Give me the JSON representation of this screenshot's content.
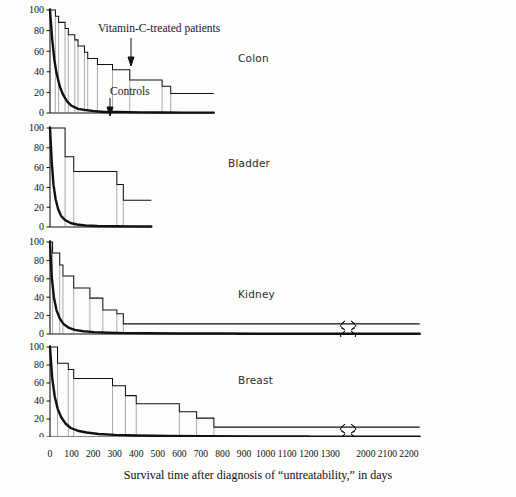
{
  "figure": {
    "xlabel": "Survival time after diagnosis of “untreatability,” in days",
    "annotations": {
      "treated": "Vitamin-C-treated patients",
      "controls": "Controls"
    }
  },
  "chart_data": {
    "type": "line",
    "title": "",
    "xlabel": "Survival time after diagnosis of “untreatability,” in days",
    "ylabel": "",
    "ylim": [
      0,
      100
    ],
    "xlim": [
      0,
      2250
    ],
    "grid": false,
    "legend_position": "inline-annotations",
    "axis_break": {
      "from": 1350,
      "to": 1950
    },
    "yticks": [
      0,
      20,
      40,
      60,
      80,
      100
    ],
    "xticks": [
      0,
      100,
      200,
      300,
      400,
      500,
      600,
      700,
      800,
      900,
      1000,
      1100,
      1200,
      1300,
      2000,
      2100,
      2200
    ],
    "xticklabels": [
      "0",
      "100",
      "200",
      "300",
      "400",
      "500",
      "600",
      "700",
      "800",
      "900",
      "1000",
      "1100",
      "1200",
      "1300",
      "2000",
      "2100",
      "2200"
    ],
    "panels": [
      {
        "name": "Colon",
        "xmax": 760,
        "series": [
          {
            "name": "Vitamin-C-treated patients",
            "style": "step",
            "x": [
              0,
              10,
              25,
              40,
              55,
              70,
              85,
              100,
              115,
              130,
              145,
              160,
              175,
              190,
              205,
              220,
              250,
              290,
              330,
              370,
              420,
              470,
              520,
              560,
              610,
              660,
              760
            ],
            "y": [
              100,
              100,
              94,
              88,
              88,
              82,
              76,
              76,
              71,
              65,
              65,
              59,
              53,
              53,
              53,
              47,
              47,
              42,
              42,
              32,
              32,
              32,
              26,
              19,
              19,
              19,
              19
            ]
          },
          {
            "name": "Controls",
            "style": "smooth",
            "x": [
              0,
              10,
              20,
              30,
              45,
              60,
              80,
              100,
              130,
              160,
              200,
              250,
              320,
              420,
              520,
              620,
              760
            ],
            "y": [
              100,
              72,
              52,
              39,
              26,
              18,
              11,
              7,
              4,
              3,
              2,
              1,
              1,
              0.6,
              0.5,
              0.4,
              0.4
            ]
          }
        ]
      },
      {
        "name": "Bladder",
        "xmax": 470,
        "series": [
          {
            "name": "Vitamin-C-treated patients",
            "style": "step",
            "x": [
              0,
              35,
              70,
              110,
              220,
              290,
              310,
              340,
              470
            ],
            "y": [
              100,
              100,
              71,
              56,
              56,
              56,
              43,
              27,
              27
            ]
          },
          {
            "name": "Controls",
            "style": "smooth",
            "x": [
              0,
              8,
              16,
              26,
              38,
              52,
              70,
              95,
              125,
              165,
              220,
              300,
              380,
              470
            ],
            "y": [
              100,
              66,
              43,
              28,
              18,
              11,
              7,
              4,
              2.5,
              1.5,
              1,
              0.8,
              0.6,
              0.5
            ]
          }
        ]
      },
      {
        "name": "Kidney",
        "xmax": 2250,
        "series": [
          {
            "name": "Vitamin-C-treated patients",
            "style": "step",
            "x": [
              0,
              12,
              25,
              45,
              60,
              80,
              110,
              150,
              185,
              215,
              245,
              275,
              310,
              340,
              2250
            ],
            "y": [
              100,
              88,
              88,
              75,
              63,
              63,
              50,
              50,
              39,
              39,
              26,
              26,
              22,
              11,
              11
            ]
          },
          {
            "name": "Controls",
            "style": "smooth",
            "x": [
              0,
              8,
              18,
              30,
              45,
              62,
              85,
              115,
              155,
              205,
              270,
              350,
              460,
              600,
              800,
              1100,
              1400,
              2250
            ],
            "y": [
              100,
              62,
              40,
              26,
              17,
              11,
              7,
              4.5,
              3,
              2,
              1.4,
              1,
              0.8,
              0.6,
              0.5,
              0.4,
              0.3,
              0.3
            ]
          }
        ]
      },
      {
        "name": "Breast",
        "xmax": 2250,
        "series": [
          {
            "name": "Vitamin-C-treated patients",
            "style": "step",
            "x": [
              0,
              15,
              35,
              55,
              85,
              110,
              210,
              250,
              290,
              310,
              350,
              400,
              450,
              510,
              570,
              600,
              630,
              680,
              720,
              760,
              2250
            ],
            "y": [
              100,
              100,
              82,
              82,
              75,
              65,
              65,
              65,
              57,
              57,
              46,
              37,
              37,
              37,
              37,
              28,
              28,
              21,
              21,
              11,
              11
            ]
          },
          {
            "name": "Controls",
            "style": "smooth",
            "x": [
              0,
              10,
              22,
              36,
              52,
              72,
              96,
              128,
              170,
              225,
              300,
              400,
              540,
              720,
              960,
              1200,
              1400,
              2250
            ],
            "y": [
              100,
              66,
              45,
              31,
              22,
              15,
              10,
              7,
              5,
              3.4,
              2.4,
              1.7,
              1.2,
              0.9,
              0.7,
              0.6,
              0.5,
              0.4
            ]
          }
        ]
      }
    ]
  }
}
